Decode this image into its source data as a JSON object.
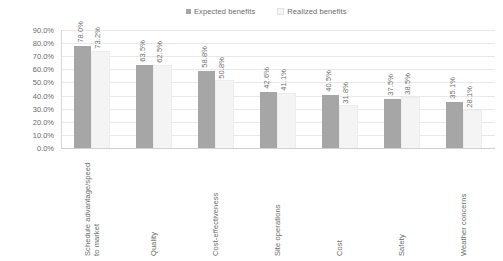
{
  "chart_data": {
    "type": "bar",
    "title": "",
    "subtitle": "",
    "xlabel": "",
    "ylabel": "",
    "ylim": [
      0,
      0.9
    ],
    "grid": true,
    "legend_position": "top-center",
    "y_tick_labels": [
      "90.0%",
      "80.0%",
      "70.0%",
      "60.0%",
      "50.0%",
      "40.0%",
      "30.0%",
      "20.0%",
      "10.0%",
      "0.0%"
    ],
    "y_tick_values": [
      90.0,
      80.0,
      70.0,
      60.0,
      50.0,
      40.0,
      30.0,
      20.0,
      10.0,
      0.0
    ],
    "categories": [
      "Schedule advantage/speed\nto market",
      "Quality",
      "Cost-effectiveness",
      "Site operations",
      "Cost",
      "Safety",
      "Weather concerns"
    ],
    "series": [
      {
        "name": "Expected benefits",
        "color": "#a6a6a6",
        "values": [
          78.0,
          63.5,
          58.8,
          42.6,
          40.5,
          37.5,
          35.1
        ],
        "labels": [
          "78.0%",
          "63.5%",
          "58.8%",
          "42.6%",
          "40.5%",
          "37.5%",
          "35.1%"
        ]
      },
      {
        "name": "Realized benefits",
        "color": "#f4f4f4",
        "values": [
          73.2,
          62.5,
          50.8,
          41.1,
          31.8,
          38.5,
          28.1
        ],
        "labels": [
          "73.2%",
          "62.5%",
          "50.8%",
          "41.1%",
          "31.8%",
          "38.5%",
          "28.1%"
        ]
      }
    ]
  },
  "colors": {
    "series_expected": "#a6a6a6",
    "series_realized": "#f4f4f4",
    "gridline": "#e9e9e9",
    "axis": "#d0d0d0",
    "text": "#6b6b6b",
    "background": "#ffffff"
  }
}
